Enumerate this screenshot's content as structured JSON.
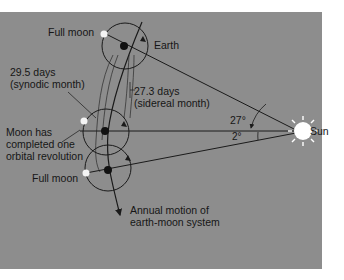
{
  "diagram": {
    "labels": {
      "full_moon_top": "Full moon",
      "earth": "Earth",
      "synodic_line1": "29.5 days",
      "synodic_line2": "(synodic month)",
      "sidereal_line1": "27.3 days",
      "sidereal_line2": "(sidereal month)",
      "angle_large": "27°",
      "angle_small": "2°",
      "sun": "Sun",
      "moon_completed_line1": "Moon has",
      "moon_completed_line2": "completed one",
      "moon_completed_line3": "orbital revolution",
      "full_moon_bottom": "Full moon",
      "annual_line1": "Annual motion of",
      "annual_line2": "earth-moon system"
    },
    "colors": {
      "background": "#8d8d8d",
      "line": "#1a1a1a",
      "moon": "#f4f4f4",
      "sun": "#ffffff"
    }
  }
}
